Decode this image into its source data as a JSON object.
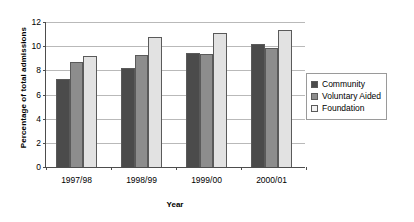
{
  "chart_data": {
    "type": "bar",
    "title": "",
    "xlabel": "Year",
    "ylabel": "Percentage of total admissions",
    "categories": [
      "1997/98",
      "1998/99",
      "1999/00",
      "2000/01"
    ],
    "series": [
      {
        "name": "Community",
        "color": "#4b4b4b",
        "values": [
          7.2,
          8.15,
          9.35,
          10.1
        ]
      },
      {
        "name": "Voluntary Aided",
        "color": "#8d8d8d",
        "values": [
          8.6,
          9.2,
          9.25,
          9.75
        ]
      },
      {
        "name": "Foundation",
        "color": "#e2e2e2",
        "values": [
          9.1,
          10.65,
          11.0,
          11.3
        ]
      }
    ],
    "ylim": [
      0,
      12
    ],
    "yticks": [
      0,
      2,
      4,
      6,
      8,
      10,
      12
    ],
    "ytick_labels": [
      "0",
      "2",
      "4",
      "6",
      "8",
      "10",
      "12"
    ],
    "grid": true,
    "legend_position": "right"
  }
}
